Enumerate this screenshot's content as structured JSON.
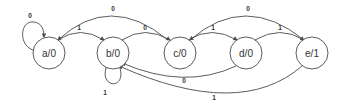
{
  "diagram": {
    "type": "state-machine",
    "colors": {
      "stroke": "#4a4a4a",
      "text": "#333333",
      "background": "#ffffff"
    },
    "states": [
      {
        "id": "a",
        "label": "a/0"
      },
      {
        "id": "b",
        "label": "b/0"
      },
      {
        "id": "c",
        "label": "c/0"
      },
      {
        "id": "d",
        "label": "d/0"
      },
      {
        "id": "e",
        "label": "e/1"
      }
    ],
    "transitions": [
      {
        "from": "a",
        "to": "a",
        "label": "0"
      },
      {
        "from": "a",
        "to": "b",
        "label": "1"
      },
      {
        "from": "b",
        "to": "b",
        "label": "1"
      },
      {
        "from": "b",
        "to": "c",
        "label": "0"
      },
      {
        "from": "c",
        "to": "a",
        "label": "0"
      },
      {
        "from": "c",
        "to": "d",
        "label": "1"
      },
      {
        "from": "d",
        "to": "e",
        "label": "1"
      },
      {
        "from": "e",
        "to": "c",
        "label": "0"
      },
      {
        "from": "d",
        "to": "b",
        "label": "0"
      },
      {
        "from": "e",
        "to": "b",
        "label": "1"
      }
    ]
  }
}
